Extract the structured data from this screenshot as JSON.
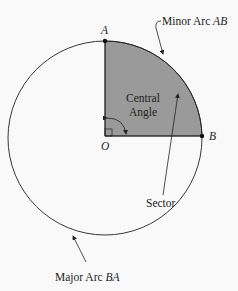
{
  "diagram": {
    "points": {
      "A": "A",
      "B": "B",
      "O": "O"
    },
    "labels": {
      "minor_arc_text": "Minor Arc ",
      "minor_arc_var": "AB",
      "major_arc_text": "Major Arc ",
      "major_arc_var": "BA",
      "central_line1": "Central",
      "central_line2": "Angle",
      "sector": "Sector"
    },
    "colors": {
      "sector_fill": "#9a9a9a",
      "stroke": "#222222",
      "background": "#f9f9f9"
    }
  }
}
